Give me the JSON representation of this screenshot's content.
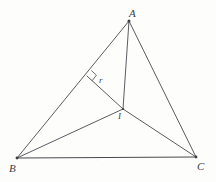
{
  "figure": {
    "kind": "geometry-diagram",
    "width": 216,
    "height": 182,
    "background_color": "#fdfdfc",
    "stroke_color": "#4a4a50",
    "stroke_width": 0.9,
    "label_color": "#3e3e45"
  },
  "points": {
    "A": {
      "label": "A",
      "x": 129,
      "y": 21,
      "label_x": 129,
      "label_y": 8
    },
    "B": {
      "label": "B",
      "x": 17,
      "y": 158,
      "label_x": 9,
      "label_y": 163
    },
    "C": {
      "label": "C",
      "x": 196,
      "y": 157,
      "label_x": 197,
      "label_y": 161
    },
    "I": {
      "label": "I",
      "x": 123,
      "y": 109,
      "label_x": 118,
      "label_y": 112
    },
    "F": {
      "label": "",
      "x": 87,
      "y": 76,
      "label_x": 0,
      "label_y": 0
    }
  },
  "segments": [
    {
      "name": "side-AB",
      "from": "A",
      "to": "B",
      "x1": 129,
      "y1": 21,
      "x2": 17,
      "y2": 158
    },
    {
      "name": "side-BC",
      "from": "B",
      "to": "C",
      "x1": 17,
      "y1": 158,
      "x2": 196,
      "y2": 157
    },
    {
      "name": "side-CA",
      "from": "C",
      "to": "A",
      "x1": 196,
      "y1": 157,
      "x2": 129,
      "y2": 21
    },
    {
      "name": "bisector-AI",
      "from": "A",
      "to": "I",
      "x1": 129,
      "y1": 21,
      "x2": 123,
      "y2": 109
    },
    {
      "name": "bisector-BI",
      "from": "B",
      "to": "I",
      "x1": 17,
      "y1": 158,
      "x2": 123,
      "y2": 109
    },
    {
      "name": "bisector-CI",
      "from": "C",
      "to": "I",
      "x1": 196,
      "y1": 157,
      "x2": 123,
      "y2": 109
    },
    {
      "name": "inradius-IF",
      "from": "I",
      "to": "F",
      "x1": 123,
      "y1": 109,
      "x2": 87,
      "y2": 76
    }
  ],
  "annotations": {
    "radius_label": {
      "text": "r",
      "x": 99,
      "y": 76
    },
    "right_angle": {
      "name": "right-angle-marker",
      "vertex_x": 87,
      "vertex_y": 76,
      "size": 7
    }
  }
}
